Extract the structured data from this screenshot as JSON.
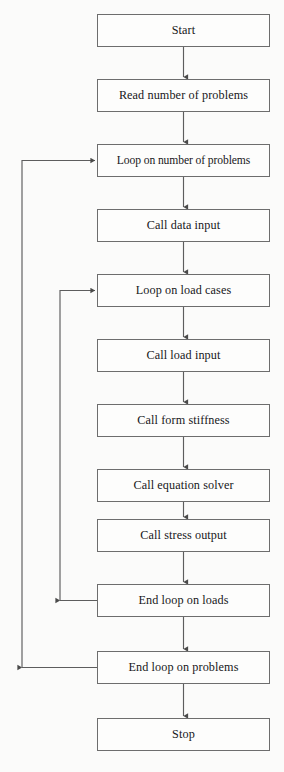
{
  "diagram": {
    "type": "flowchart",
    "background_color": "#fbfbfa",
    "box_border_color": "#6d6d6d",
    "connector_color": "#5d5d5d",
    "text_color": "#17171a",
    "nodes": [
      {
        "id": "start",
        "label": "Start",
        "x": 97,
        "y": 14,
        "w": 173,
        "h": 33
      },
      {
        "id": "read_count",
        "label": "Read number of problems",
        "x": 97,
        "y": 79,
        "w": 173,
        "h": 33
      },
      {
        "id": "loop_problems",
        "label": "Loop on number of problems",
        "x": 97,
        "y": 144,
        "w": 173,
        "h": 33
      },
      {
        "id": "data_input",
        "label": "Call data input",
        "x": 97,
        "y": 209,
        "w": 173,
        "h": 33
      },
      {
        "id": "loop_loads",
        "label": "Loop on load cases",
        "x": 97,
        "y": 274,
        "w": 173,
        "h": 33
      },
      {
        "id": "load_input",
        "label": "Call load input",
        "x": 97,
        "y": 339,
        "w": 173,
        "h": 33
      },
      {
        "id": "form_stiff",
        "label": "Call form stiffness",
        "x": 97,
        "y": 404,
        "w": 173,
        "h": 33
      },
      {
        "id": "eq_solver",
        "label": "Call equation solver",
        "x": 97,
        "y": 469,
        "w": 173,
        "h": 33
      },
      {
        "id": "stress_out",
        "label": "Call stress output",
        "x": 97,
        "y": 519,
        "w": 173,
        "h": 33
      },
      {
        "id": "end_loads",
        "label": "End loop on loads",
        "x": 97,
        "y": 584,
        "w": 173,
        "h": 33
      },
      {
        "id": "end_problems",
        "label": "End loop on problems",
        "x": 97,
        "y": 651,
        "w": 173,
        "h": 33
      },
      {
        "id": "stop",
        "label": "Stop",
        "x": 97,
        "y": 718,
        "w": 173,
        "h": 33
      }
    ],
    "connectors": [
      {
        "id": "start-to-read",
        "from": "start",
        "to": "read_count",
        "kind": "straight-down"
      },
      {
        "id": "read-to-loop-problems",
        "from": "read_count",
        "to": "loop_problems",
        "kind": "straight-down"
      },
      {
        "id": "loop-problems-to-data",
        "from": "loop_problems",
        "to": "data_input",
        "kind": "straight-down"
      },
      {
        "id": "data-to-loop-loads",
        "from": "data_input",
        "to": "loop_loads",
        "kind": "straight-down"
      },
      {
        "id": "loop-loads-to-load-input",
        "from": "loop_loads",
        "to": "load_input",
        "kind": "straight-down"
      },
      {
        "id": "load-input-to-stiffness",
        "from": "load_input",
        "to": "form_stiff",
        "kind": "straight-down"
      },
      {
        "id": "stiffness-to-solver",
        "from": "form_stiff",
        "to": "eq_solver",
        "kind": "straight-down"
      },
      {
        "id": "solver-to-stress",
        "from": "eq_solver",
        "to": "stress_out",
        "kind": "straight-down"
      },
      {
        "id": "stress-to-end-loads",
        "from": "stress_out",
        "to": "end_loads",
        "kind": "straight-down"
      },
      {
        "id": "end-loads-to-end-problems",
        "from": "end_loads",
        "to": "end_problems",
        "kind": "straight-down"
      },
      {
        "id": "end-problems-to-stop",
        "from": "end_problems",
        "to": "stop",
        "kind": "straight-down"
      },
      {
        "id": "inner-loop-feedback",
        "from": "end_loads",
        "to": "loop_loads",
        "kind": "feedback-left",
        "rail_x": 60
      },
      {
        "id": "outer-loop-feedback",
        "from": "end_problems",
        "to": "loop_problems",
        "kind": "feedback-left",
        "rail_x": 22
      }
    ]
  }
}
